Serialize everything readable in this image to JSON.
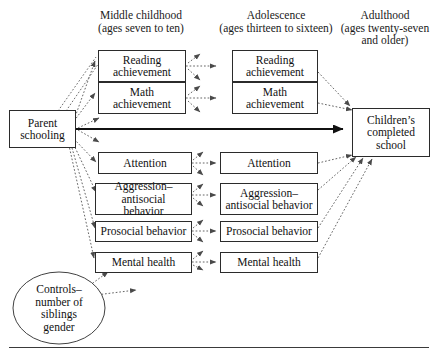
{
  "figure": {
    "type": "path-diagram",
    "columns": [
      {
        "id": "middle-childhood",
        "title": "Middle childhood",
        "subtitle": "(ages seven to ten)"
      },
      {
        "id": "adolescence",
        "title": "Adolescence",
        "subtitle": "(ages thirteen to sixteen)"
      },
      {
        "id": "adulthood",
        "title": "Adulthood",
        "subtitle": "(ages twenty-seven",
        "subtitle2": "and older)"
      }
    ],
    "nodes": {
      "parent_schooling": {
        "line1": "Parent",
        "line2": "schooling"
      },
      "mc_reading": {
        "line1": "Reading",
        "line2": "achievement"
      },
      "mc_math": {
        "line1": "Math",
        "line2": "achievement"
      },
      "mc_attention": {
        "line1": "Attention"
      },
      "mc_aggression": {
        "line1": "Aggression–",
        "line2": "antisocial behavior"
      },
      "mc_prosocial": {
        "line1": "Prosocial behavior"
      },
      "mc_mental": {
        "line1": "Mental health"
      },
      "ad_reading": {
        "line1": "Reading",
        "line2": "achievement"
      },
      "ad_math": {
        "line1": "Math",
        "line2": "achievement"
      },
      "ad_attention": {
        "line1": "Attention"
      },
      "ad_aggression": {
        "line1": "Aggression–",
        "line2": "antisocial behavior"
      },
      "ad_prosocial": {
        "line1": "Prosocial behavior"
      },
      "ad_mental": {
        "line1": "Mental health"
      },
      "outcome": {
        "line1": "Children’s",
        "line2": "completed",
        "line3": "school"
      },
      "controls": {
        "line1": "Controls–",
        "line2": "number of",
        "line3": "siblings",
        "line4": "gender"
      }
    },
    "colors": {
      "box_border": "#2b2b2b",
      "arrow_dotted": "#4a4a4a",
      "arrow_solid": "#111111",
      "rule": "#3a3a3a",
      "background": "#ffffff"
    }
  }
}
